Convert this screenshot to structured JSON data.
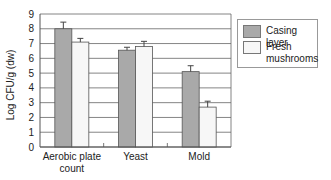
{
  "chart_data": {
    "type": "bar",
    "title": "",
    "xlabel": "",
    "ylabel": "Log CFU/g (dw)",
    "ylim": [
      0,
      9
    ],
    "yticks": [
      0,
      1,
      2,
      3,
      4,
      5,
      6,
      7,
      8,
      9
    ],
    "grid": true,
    "legend_position": "right",
    "categories": [
      "Aerobic plate count",
      "Yeast",
      "Mold"
    ],
    "category_labels": [
      [
        "Aerobic plate",
        "count"
      ],
      [
        "Yeast"
      ],
      [
        "Mold"
      ]
    ],
    "series": [
      {
        "name": "Casing layer",
        "color": "#a9a9a9",
        "values": [
          8.0,
          6.55,
          5.1
        ],
        "errors": [
          0.45,
          0.2,
          0.4
        ]
      },
      {
        "name": "Fresh mushrooms",
        "color": "#f7f7f7",
        "values": [
          7.1,
          6.8,
          2.7
        ],
        "errors": [
          0.25,
          0.35,
          0.4
        ]
      }
    ]
  },
  "legend": {
    "items": [
      {
        "label_lines": [
          "Casing layer"
        ],
        "color": "#a9a9a9"
      },
      {
        "label_lines": [
          "Fresh",
          "mushrooms"
        ],
        "color": "#f7f7f7"
      }
    ]
  }
}
